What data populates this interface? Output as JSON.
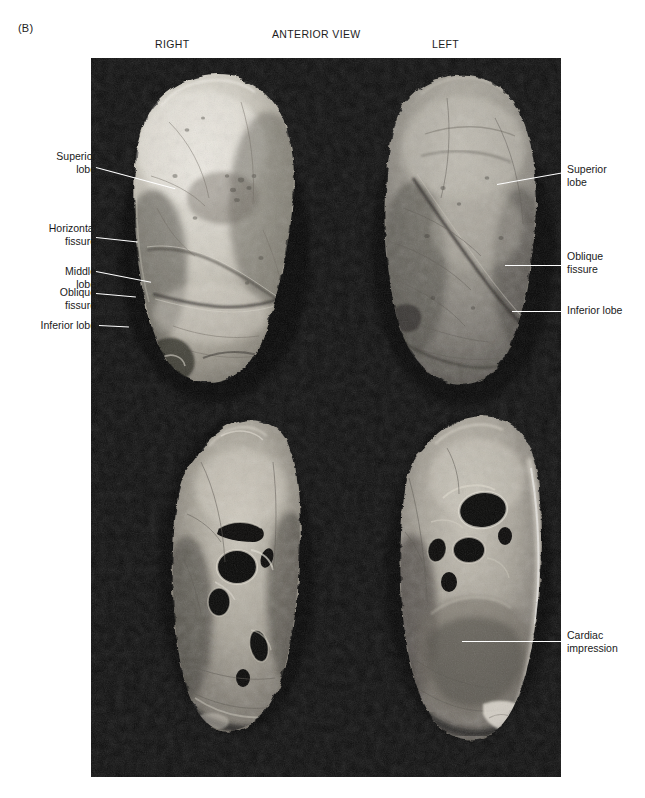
{
  "figure": {
    "panel_letter": "(B)",
    "view_title": "ANTERIOR VIEW",
    "side_left_header": "RIGHT",
    "side_right_header": "LEFT",
    "background_color": "#0b0b0b",
    "page_color": "#ffffff",
    "leader_color": "#ffffff",
    "text_color": "#1a1a1a"
  },
  "labels_left": [
    {
      "id": "superior-lobe-right",
      "text": "Superior\nlobe"
    },
    {
      "id": "horizontal-fissure",
      "text": "Horizontal\nfissure"
    },
    {
      "id": "middle-lobe",
      "text": "Middle\nlobe"
    },
    {
      "id": "oblique-fissure-right",
      "text": "Oblique\nfissure"
    },
    {
      "id": "inferior-lobe-right",
      "text": "Inferior lobe"
    }
  ],
  "labels_right": [
    {
      "id": "superior-lobe-left",
      "text": "Superior\nlobe"
    },
    {
      "id": "oblique-fissure-left",
      "text": "Oblique\nfissure"
    },
    {
      "id": "inferior-lobe-left",
      "text": "Inferior lobe"
    },
    {
      "id": "cardiac-impression",
      "text": "Cardiac\nimpression"
    }
  ],
  "specimens": [
    {
      "id": "right-lung-lateral",
      "position": "top-left",
      "description": "Right lung, anterior/lateral surface"
    },
    {
      "id": "left-lung-lateral",
      "position": "top-right",
      "description": "Left lung, anterior/lateral surface"
    },
    {
      "id": "right-lung-medial",
      "position": "bottom-left",
      "description": "Right lung, medial surface with hilum"
    },
    {
      "id": "left-lung-medial",
      "position": "bottom-right",
      "description": "Left lung, medial surface with hilum and cardiac impression"
    }
  ]
}
